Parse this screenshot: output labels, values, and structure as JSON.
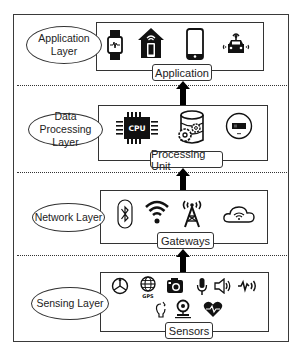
{
  "diagram": {
    "type": "layered-architecture",
    "direction": "bottom-to-top",
    "layers": [
      {
        "name": "Application Layer",
        "name_line1": "Application",
        "name_line2": "Layer",
        "unit_label": "Application",
        "icons": [
          "smartwatch-icon",
          "smart-home-icon",
          "smartphone-icon",
          "connected-car-icon"
        ]
      },
      {
        "name": "Data Processing Layer",
        "name_line1": "Data Processing",
        "name_line2": "Layer",
        "unit_label": "Processing Unit",
        "icons": [
          "cpu-icon",
          "database-gear-icon",
          "storage-card-icon"
        ],
        "cpu_text": "CPU"
      },
      {
        "name": "Network Layer",
        "name_line1": "Network Layer",
        "unit_label": "Gateways",
        "icons": [
          "bluetooth-icon",
          "wifi-icon",
          "cell-tower-icon",
          "cloud-wifi-icon"
        ]
      },
      {
        "name": "Sensing Layer",
        "name_line1": "Sensing Layer",
        "unit_label": "Sensors",
        "icons": [
          "gyroscope-icon",
          "gps-icon",
          "camera-icon",
          "microphone-icon",
          "speaker-icon",
          "vibration-icon",
          "light-bulb-icon",
          "pressure-sensor-icon",
          "heart-rate-icon"
        ],
        "gps_text": "GPS"
      }
    ],
    "edges": [
      {
        "from": "Sensors",
        "to": "Gateways"
      },
      {
        "from": "Gateways",
        "to": "Processing Unit"
      },
      {
        "from": "Processing Unit",
        "to": "Application"
      }
    ]
  }
}
